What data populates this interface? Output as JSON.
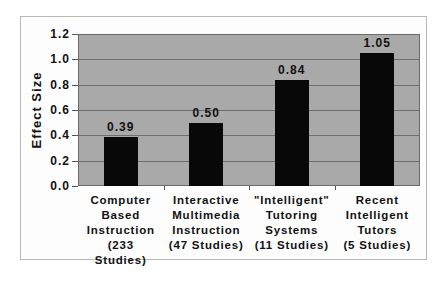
{
  "chart_data": {
    "type": "bar",
    "title": "",
    "xlabel": "",
    "ylabel": "Effect Size",
    "ylim": [
      0,
      1.2
    ],
    "yticks": [
      "0.0",
      "0.2",
      "0.4",
      "0.6",
      "0.8",
      "1.0",
      "1.2"
    ],
    "grid": true,
    "legend": null,
    "categories": [
      "Computer Based Instruction (233 Studies)",
      "Interactive Multimedia Instruction (47 Studies)",
      "\"Intelligent\" Tutoring Systems (11 Studies)",
      "Recent Intelligent Tutors (5 Studies)"
    ],
    "category_lines": [
      [
        "Computer",
        "Based",
        "Instruction",
        "(233",
        "Studies)"
      ],
      [
        "Interactive",
        "Multimedia",
        "Instruction",
        "(47  Studies)"
      ],
      [
        "\"Intelligent\"",
        "Tutoring",
        "Systems",
        "(11  Studies)"
      ],
      [
        "Recent",
        "Intelligent",
        "Tutors",
        "(5  Studies)"
      ]
    ],
    "values": [
      0.39,
      0.5,
      0.84,
      1.05
    ],
    "value_labels": [
      "0.39",
      "0.50",
      "0.84",
      "1.05"
    ],
    "colors": {
      "bar": "#080808",
      "plot_bg": "#a9a9a9",
      "grid": "#6e6e6e"
    }
  }
}
